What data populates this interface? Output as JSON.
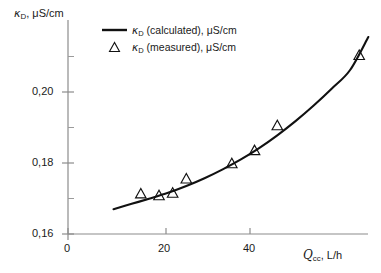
{
  "chart_data": {
    "type": "line",
    "title": "",
    "subtitle": "",
    "xlabel": "Q_cc, L/h",
    "ylabel": "κ_D, μS/cm",
    "xlim": [
      0,
      68
    ],
    "ylim": [
      0.16,
      0.2165
    ],
    "xticks": [
      0,
      20,
      40
    ],
    "xtick_labels": [
      "0",
      "20",
      "40"
    ],
    "yticks": [
      0.16,
      0.18,
      0.2
    ],
    "ytick_labels": [
      "0,16",
      "0,18",
      "0,20"
    ],
    "y_minor_ticks": [
      0.17,
      0.19,
      0.21
    ],
    "x_minor_ticks": [
      10,
      30,
      50
    ],
    "grid": false,
    "legend_position": "top-left-inside",
    "decimal_separator": ",",
    "series": [
      {
        "name": "κ_D (calculated), μS/cm",
        "type": "line",
        "style": "solid",
        "color": "#111111",
        "x": [
          10,
          14,
          18,
          22,
          26,
          30,
          34,
          38,
          42,
          46,
          50,
          54,
          58,
          62,
          66
        ],
        "values": [
          0.167,
          0.1685,
          0.17,
          0.1716,
          0.1735,
          0.1757,
          0.1782,
          0.181,
          0.1842,
          0.1878,
          0.1918,
          0.1962,
          0.201,
          0.2062,
          0.2155
        ]
      },
      {
        "name": "κ_D (measured), μS/cm",
        "type": "scatter",
        "marker": "triangle-up-open",
        "color": "#111111",
        "x": [
          16,
          20,
          23,
          26,
          36,
          41,
          46,
          64
        ],
        "values": [
          0.1715,
          0.171,
          0.1717,
          0.1757,
          0.18,
          0.1837,
          0.1907,
          0.2105
        ]
      }
    ]
  },
  "labels": {
    "y_axis_symbol": "κ",
    "y_axis_subscript": "D",
    "y_axis_unit": ", μS/cm",
    "x_axis_symbol": "Q",
    "x_axis_subscript": "cc",
    "x_axis_unit": ", L/h",
    "ytick_020": "0,20",
    "ytick_018": "0,18",
    "ytick_016": "0,16",
    "xtick_0": "0",
    "xtick_20": "20",
    "xtick_40": "40"
  },
  "legend": {
    "calculated": {
      "symbol": "κ",
      "subscript": "D",
      "text": " (calculated), μS/cm"
    },
    "measured": {
      "symbol": "κ",
      "subscript": "D",
      "text": " (measured), μS/cm"
    }
  },
  "colors": {
    "curve": "#111111",
    "marker": "#111111",
    "axis": "#8c8c8c",
    "text": "#1a1a1a",
    "background": "#ffffff"
  }
}
